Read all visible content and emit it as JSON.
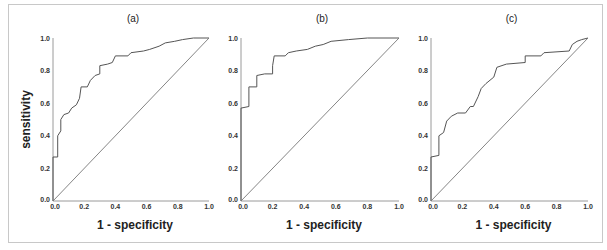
{
  "figure": {
    "ylabel": "sensitivity",
    "xlabel": "1 - specificity",
    "tick_labels": [
      "0.0",
      "0.2",
      "0.4",
      "0.6",
      "0.8",
      "1.0"
    ]
  },
  "chart_data": [
    {
      "type": "line",
      "title": "(a)",
      "xlabel": "1 - specificity",
      "ylabel": "sensitivity",
      "xlim": [
        0,
        1
      ],
      "ylim": [
        0,
        1
      ],
      "xticks": [
        0.0,
        0.2,
        0.4,
        0.6,
        0.8,
        1.0
      ],
      "yticks": [
        0.0,
        0.2,
        0.4,
        0.6,
        0.8,
        1.0
      ],
      "grid": false,
      "series": [
        {
          "name": "ROC",
          "x": [
            0,
            0,
            0.03,
            0.03,
            0.05,
            0.05,
            0.07,
            0.1,
            0.12,
            0.15,
            0.17,
            0.18,
            0.22,
            0.24,
            0.27,
            0.3,
            0.3,
            0.35,
            0.38,
            0.4,
            0.48,
            0.5,
            0.58,
            0.62,
            0.68,
            0.72,
            0.78,
            0.83,
            0.9,
            1.0
          ],
          "y": [
            0,
            0.27,
            0.27,
            0.4,
            0.43,
            0.5,
            0.53,
            0.54,
            0.57,
            0.59,
            0.63,
            0.7,
            0.7,
            0.74,
            0.77,
            0.78,
            0.83,
            0.84,
            0.85,
            0.89,
            0.89,
            0.91,
            0.92,
            0.93,
            0.95,
            0.97,
            0.98,
            0.99,
            1.0,
            1.0
          ]
        },
        {
          "name": "Reference",
          "x": [
            0,
            1
          ],
          "y": [
            0,
            1
          ]
        }
      ]
    },
    {
      "type": "line",
      "title": "(b)",
      "xlabel": "1 - specificity",
      "ylabel": "",
      "xlim": [
        0,
        1
      ],
      "ylim": [
        0,
        1
      ],
      "xticks": [
        0.0,
        0.2,
        0.4,
        0.6,
        0.8,
        1.0
      ],
      "yticks": [
        0.0,
        0.2,
        0.4,
        0.6,
        0.8,
        1.0
      ],
      "grid": false,
      "series": [
        {
          "name": "ROC",
          "x": [
            0,
            0,
            0.05,
            0.05,
            0.1,
            0.1,
            0.15,
            0.2,
            0.2,
            0.21,
            0.28,
            0.3,
            0.35,
            0.42,
            0.47,
            0.52,
            0.57,
            0.68,
            0.8,
            1.0
          ],
          "y": [
            0,
            0.57,
            0.58,
            0.7,
            0.7,
            0.77,
            0.78,
            0.78,
            0.83,
            0.89,
            0.89,
            0.91,
            0.92,
            0.93,
            0.95,
            0.96,
            0.98,
            0.99,
            1.0,
            1.0
          ]
        },
        {
          "name": "Reference",
          "x": [
            0,
            1
          ],
          "y": [
            0,
            1
          ]
        }
      ]
    },
    {
      "type": "line",
      "title": "(c)",
      "xlabel": "1 - specificity",
      "ylabel": "",
      "xlim": [
        0,
        1
      ],
      "ylim": [
        0,
        1
      ],
      "xticks": [
        0.0,
        0.2,
        0.4,
        0.6,
        0.8,
        1.0
      ],
      "yticks": [
        0.0,
        0.2,
        0.4,
        0.6,
        0.8,
        1.0
      ],
      "grid": false,
      "series": [
        {
          "name": "ROC",
          "x": [
            0,
            0,
            0.05,
            0.05,
            0.08,
            0.1,
            0.13,
            0.17,
            0.22,
            0.25,
            0.27,
            0.3,
            0.32,
            0.35,
            0.4,
            0.42,
            0.48,
            0.6,
            0.6,
            0.7,
            0.72,
            0.88,
            0.9,
            0.93,
            0.96,
            1.0
          ],
          "y": [
            0,
            0.27,
            0.28,
            0.4,
            0.42,
            0.49,
            0.52,
            0.54,
            0.54,
            0.58,
            0.58,
            0.64,
            0.69,
            0.72,
            0.76,
            0.82,
            0.84,
            0.85,
            0.89,
            0.89,
            0.91,
            0.92,
            0.96,
            0.98,
            0.99,
            1.0
          ]
        },
        {
          "name": "Reference",
          "x": [
            0,
            1
          ],
          "y": [
            0,
            1
          ]
        }
      ]
    }
  ]
}
